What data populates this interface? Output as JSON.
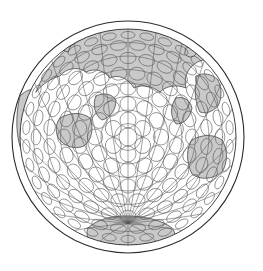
{
  "figure": {
    "name": "globe-orthographic-projection",
    "type": "map",
    "title": "",
    "caption": "",
    "background_color": "#ffffff"
  },
  "globe": {
    "center_x": 128,
    "center_y": 137,
    "outer_radius": 116,
    "inner_radius": 108,
    "limb_stroke_color": "#2b2b2b",
    "limb_stroke_width": 1.1,
    "limb_fill_color": "#ffffff",
    "disc_fill_color": "#ffffff"
  },
  "colors": {
    "land_fill": "#c9c9c9",
    "land_stroke": "#4a4a4a",
    "ocean_fill": "#ffffff",
    "graticule_stroke": "#555555",
    "indicatrix_stroke": "#5a5a5a",
    "outline_stroke": "#2b2b2b"
  },
  "layers": [
    {
      "id": "limb",
      "label": "Globe limb ring",
      "visible": true
    },
    {
      "id": "land",
      "label": "Landmasses",
      "visible": true
    },
    {
      "id": "graticule",
      "label": "Meridian and parallel grid",
      "visible": true
    },
    {
      "id": "indicatrices",
      "label": "Tissot indicatrix circles",
      "visible": true
    }
  ],
  "landmasses": [
    {
      "name": "northern-landmass-band",
      "label": "Northern continental band",
      "path": "M 36,92 C 44,70 60,52 80,40 C 100,28 122,22 142,22 C 162,22 182,28 198,38 C 206,44 212,52 216,60 C 208,58 198,60 192,66 C 186,72 184,80 186,88 C 176,84 166,86 160,92 C 152,86 142,84 134,88 C 128,78 118,74 110,78 C 104,70 94,68 86,72 C 78,66 66,68 60,76 C 52,78 42,84 36,92 Z"
    },
    {
      "name": "north-west-notch",
      "label": "North-west coastal notch",
      "path": "M 52,44 C 60,38 70,34 78,34 C 74,40 70,46 68,52 C 62,50 56,47 52,44 Z"
    },
    {
      "name": "left-limb-land",
      "label": "Western limb landmass",
      "path": "M 20,96 C 26,90 32,88 38,90 C 40,100 40,112 38,124 C 34,136 28,146 22,152 C 16,138 15,116 20,96 Z"
    },
    {
      "name": "eastern-landmass",
      "label": "Eastern continental region",
      "path": "M 196,76 C 204,72 212,74 218,80 C 222,88 222,98 218,106 C 212,112 206,114 200,112 C 196,104 194,94 196,84 Z"
    },
    {
      "name": "south-east-landmass",
      "label": "South-eastern landmass",
      "path": "M 192,140 C 202,134 214,134 222,140 C 228,150 228,162 222,172 C 212,180 200,180 192,174 C 186,162 186,148 192,140 Z"
    },
    {
      "name": "east-peninsula",
      "label": "Eastern peninsula",
      "path": "M 176,98 C 184,96 190,100 192,108 C 190,118 184,124 176,124 C 170,116 170,106 176,98 Z"
    },
    {
      "name": "central-west-peninsula",
      "label": "Central-western peninsula",
      "path": "M 60,118 C 70,112 82,112 90,118 C 94,128 92,140 84,146 C 74,150 64,146 58,138 C 55,130 56,123 60,118 Z"
    },
    {
      "name": "mid-peninsula",
      "label": "Mid-latitude peninsula",
      "path": "M 96,96 C 104,92 112,94 116,100 C 116,110 110,118 102,120 C 95,116 92,104 96,96 Z"
    },
    {
      "name": "antarctica",
      "label": "Southern polar landmass",
      "path": "M 88,228 C 96,220 110,216 126,216 C 144,216 162,220 172,228 C 178,236 176,244 168,248 C 152,254 128,256 108,252 C 92,248 84,238 88,228 Z"
    },
    {
      "name": "small-island-east",
      "label": "Eastern island",
      "path": "M 208,54 C 214,52 219,55 220,60 C 218,65 212,66 208,62 Z"
    },
    {
      "name": "small-island-northeast",
      "label": "North-eastern island",
      "path": "M 186,48 C 192,46 196,49 196,54 C 193,58 188,58 185,54 Z"
    }
  ],
  "graticule": {
    "meridian_count": 24,
    "parallel_count": 7,
    "pole_convergence": "south",
    "stroke_width": 0.55
  },
  "indicatrices": {
    "description": "Concentric rings of distortion circles",
    "rings": [
      {
        "radius_from_center": 0,
        "count": 1,
        "circle_radius": 9
      },
      {
        "radius_from_center": 17,
        "count": 6,
        "circle_radius": 8
      },
      {
        "radius_from_center": 33,
        "count": 12,
        "circle_radius": 8
      },
      {
        "radius_from_center": 49,
        "count": 18,
        "circle_radius": 8
      },
      {
        "radius_from_center": 64,
        "count": 22,
        "circle_radius": 8
      },
      {
        "radius_from_center": 79,
        "count": 26,
        "circle_radius": 8
      },
      {
        "radius_from_center": 92,
        "count": 30,
        "circle_radius": 8
      },
      {
        "radius_from_center": 102,
        "count": 34,
        "circle_radius": 7
      }
    ],
    "stroke_width": 0.6
  }
}
